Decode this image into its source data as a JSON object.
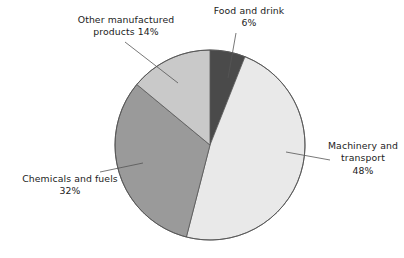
{
  "chart_data": {
    "type": "pie",
    "title": "",
    "subtitle": "",
    "xlabel": "",
    "ylabel": "",
    "legend_position": "none",
    "grid": false,
    "start_angle_deg": 0,
    "direction": "clockwise",
    "categories": [
      "Food and drink",
      "Machinery and transport",
      "Chemicals and fuels",
      "Other manufactured products"
    ],
    "values": [
      6,
      48,
      32,
      14
    ],
    "value_unit": "%",
    "slices": [
      {
        "label": "Food and drink",
        "value": 6,
        "value_text": "6%",
        "color": "#4a4a4a",
        "start_deg": 0,
        "end_deg": 21.6
      },
      {
        "label": "Machinery and transport",
        "value": 48,
        "value_text": "48%",
        "color": "#e9e9e9",
        "start_deg": 21.6,
        "end_deg": 194.4
      },
      {
        "label": "Chemicals and fuels",
        "value": 32,
        "value_text": "32%",
        "color": "#9a9a9a",
        "start_deg": 194.4,
        "end_deg": 309.6
      },
      {
        "label": "Other manufactured products",
        "value": 14,
        "value_text": "14%",
        "color": "#c9c9c9",
        "start_deg": 309.6,
        "end_deg": 360
      }
    ]
  },
  "labels": {
    "other": {
      "line1": "Other manufactured",
      "line2": "products 14%"
    },
    "food": {
      "line1": "Food and drink",
      "line2": "6%"
    },
    "machinery": {
      "line1": "Machinery and",
      "line2": "transport",
      "line3": "48%"
    },
    "chemicals": {
      "line1": "Chemicals and fuels",
      "line2": "32%"
    }
  },
  "style": {
    "background": "#ffffff",
    "text_color": "#1b1b1b",
    "outline_color": "#555555",
    "leader_line_color": "#555555"
  }
}
